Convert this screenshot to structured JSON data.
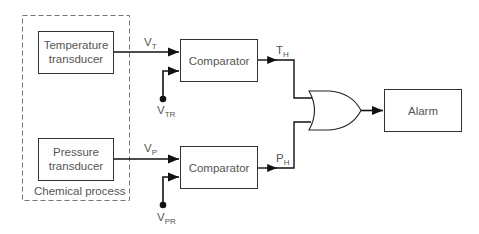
{
  "diagram": {
    "group": {
      "label": "Chemical process"
    },
    "blocks": {
      "temp_transducer": {
        "line1": "Temperature",
        "line2": "transducer"
      },
      "pressure_transducer": {
        "line1": "Pressure",
        "line2": "transducer"
      },
      "comparator_top": {
        "label": "Comparator"
      },
      "comparator_bottom": {
        "label": "Comparator"
      },
      "alarm": {
        "label": "Alarm"
      },
      "or_gate": {
        "type": "OR"
      }
    },
    "signals": {
      "vt": {
        "main": "V",
        "sub": "T"
      },
      "vtr": {
        "main": "V",
        "sub": "TR"
      },
      "vp": {
        "main": "V",
        "sub": "P"
      },
      "vpr": {
        "main": "V",
        "sub": "PR"
      },
      "th": {
        "main": "T",
        "sub": "H"
      },
      "ph": {
        "main": "P",
        "sub": "H"
      }
    },
    "colors": {
      "line": "#222222",
      "box": "#333333",
      "dash": "#777777",
      "text": "#555555"
    }
  }
}
